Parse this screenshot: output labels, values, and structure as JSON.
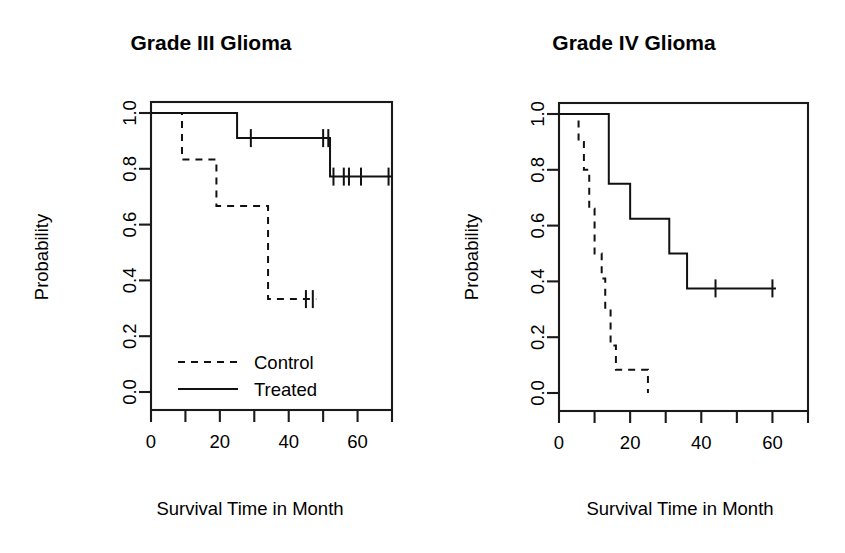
{
  "figure": {
    "background": "#ffffff",
    "line_color": "#111111",
    "panel_count": 2
  },
  "chart_data": [
    {
      "type": "line",
      "subtype": "kaplan-meier-step",
      "panel": "left",
      "title": "Grade III Glioma",
      "xlabel": "Survival Time in Month",
      "ylabel": "Probability",
      "xlim": [
        0,
        70
      ],
      "ylim": [
        0,
        1
      ],
      "xticks": [
        0,
        10,
        20,
        30,
        40,
        50,
        60,
        70
      ],
      "xtick_labels": [
        "0",
        "",
        "20",
        "",
        "40",
        "",
        "60",
        ""
      ],
      "yticks": [
        0.0,
        0.2,
        0.4,
        0.6,
        0.8,
        1.0
      ],
      "ytick_labels": [
        "0.0",
        "0.2",
        "0.4",
        "0.6",
        "0.8",
        "1.0"
      ],
      "grid": false,
      "legend_position": "bottom-left",
      "series": [
        {
          "name": "Control",
          "style": "dashed",
          "steps": [
            {
              "x": 0,
              "y": 1.0
            },
            {
              "x": 9,
              "y": 1.0
            },
            {
              "x": 9,
              "y": 0.833
            },
            {
              "x": 19,
              "y": 0.833
            },
            {
              "x": 19,
              "y": 0.667
            },
            {
              "x": 34,
              "y": 0.667
            },
            {
              "x": 34,
              "y": 0.333
            },
            {
              "x": 48,
              "y": 0.333
            }
          ],
          "censor_times": [
            45,
            47
          ]
        },
        {
          "name": "Treated",
          "style": "solid",
          "steps": [
            {
              "x": 0,
              "y": 1.0
            },
            {
              "x": 25,
              "y": 1.0
            },
            {
              "x": 25,
              "y": 0.91
            },
            {
              "x": 52,
              "y": 0.91
            },
            {
              "x": 52,
              "y": 0.772
            },
            {
              "x": 70,
              "y": 0.772
            }
          ],
          "censor_times": [
            29,
            50,
            51.5,
            53,
            56,
            57.5,
            61,
            69
          ]
        }
      ]
    },
    {
      "type": "line",
      "subtype": "kaplan-meier-step",
      "panel": "right",
      "title": "Grade IV Glioma",
      "xlabel": "Survival Time in Month",
      "ylabel": "Probability",
      "xlim": [
        0,
        70
      ],
      "ylim": [
        0,
        1
      ],
      "xticks": [
        0,
        10,
        20,
        30,
        40,
        50,
        60,
        70
      ],
      "xtick_labels": [
        "0",
        "",
        "20",
        "",
        "40",
        "",
        "60",
        ""
      ],
      "yticks": [
        0.0,
        0.2,
        0.4,
        0.6,
        0.8,
        1.0
      ],
      "ytick_labels": [
        "0.0",
        "0.2",
        "0.4",
        "0.6",
        "0.8",
        "1.0"
      ],
      "grid": false,
      "legend_position": "none",
      "series": [
        {
          "name": "Control",
          "style": "dashed",
          "steps": [
            {
              "x": 0,
              "y": 1.0
            },
            {
              "x": 5.5,
              "y": 1.0
            },
            {
              "x": 5.5,
              "y": 0.9
            },
            {
              "x": 7,
              "y": 0.9
            },
            {
              "x": 7,
              "y": 0.8
            },
            {
              "x": 8.5,
              "y": 0.8
            },
            {
              "x": 8.5,
              "y": 0.66
            },
            {
              "x": 10,
              "y": 0.66
            },
            {
              "x": 10,
              "y": 0.5
            },
            {
              "x": 12,
              "y": 0.5
            },
            {
              "x": 12,
              "y": 0.41
            },
            {
              "x": 13,
              "y": 0.41
            },
            {
              "x": 13,
              "y": 0.3
            },
            {
              "x": 14.5,
              "y": 0.3
            },
            {
              "x": 14.5,
              "y": 0.17
            },
            {
              "x": 16,
              "y": 0.17
            },
            {
              "x": 16,
              "y": 0.083
            },
            {
              "x": 25,
              "y": 0.083
            },
            {
              "x": 25,
              "y": 0.0
            }
          ],
          "censor_times": []
        },
        {
          "name": "Treated",
          "style": "solid",
          "steps": [
            {
              "x": 0,
              "y": 1.0
            },
            {
              "x": 14,
              "y": 1.0
            },
            {
              "x": 14,
              "y": 0.75
            },
            {
              "x": 20,
              "y": 0.75
            },
            {
              "x": 20,
              "y": 0.625
            },
            {
              "x": 31,
              "y": 0.625
            },
            {
              "x": 31,
              "y": 0.5
            },
            {
              "x": 36,
              "y": 0.5
            },
            {
              "x": 36,
              "y": 0.375
            },
            {
              "x": 61,
              "y": 0.375
            }
          ],
          "censor_times": [
            44,
            60
          ]
        }
      ]
    }
  ],
  "legend": {
    "entries": [
      {
        "label": "Control",
        "style": "dashed"
      },
      {
        "label": "Treated",
        "style": "solid"
      }
    ]
  }
}
